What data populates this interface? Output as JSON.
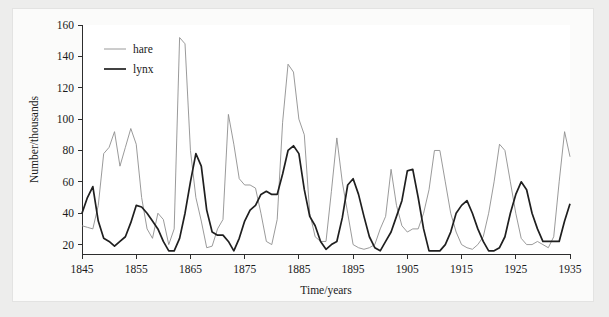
{
  "chart_data": {
    "type": "line",
    "title": "",
    "xlabel": "Time/years",
    "ylabel": "Number/thousands",
    "xlim": [
      1845,
      1935
    ],
    "ylim": [
      14,
      160
    ],
    "xticks": [
      1845,
      1855,
      1865,
      1875,
      1885,
      1895,
      1905,
      1915,
      1925,
      1935
    ],
    "yticks": [
      20,
      40,
      60,
      80,
      100,
      120,
      140,
      160
    ],
    "grid": false,
    "legend_position": "top-left-inside",
    "x": [
      1845,
      1846,
      1847,
      1848,
      1849,
      1850,
      1851,
      1852,
      1853,
      1854,
      1855,
      1856,
      1857,
      1858,
      1859,
      1860,
      1861,
      1862,
      1863,
      1864,
      1865,
      1866,
      1867,
      1868,
      1869,
      1870,
      1871,
      1872,
      1873,
      1874,
      1875,
      1876,
      1877,
      1878,
      1879,
      1880,
      1881,
      1882,
      1883,
      1884,
      1885,
      1886,
      1887,
      1888,
      1889,
      1890,
      1891,
      1892,
      1893,
      1894,
      1895,
      1896,
      1897,
      1898,
      1899,
      1900,
      1901,
      1902,
      1903,
      1904,
      1905,
      1906,
      1907,
      1908,
      1909,
      1910,
      1911,
      1912,
      1913,
      1914,
      1915,
      1916,
      1917,
      1918,
      1919,
      1920,
      1921,
      1922,
      1923,
      1924,
      1925,
      1926,
      1927,
      1928,
      1929,
      1930,
      1931,
      1932,
      1933,
      1934,
      1935
    ],
    "series": [
      {
        "name": "hare",
        "color": "#8f8f8f",
        "line_width": 0.9,
        "values": [
          32,
          31,
          30,
          45,
          78,
          82,
          92,
          70,
          82,
          94,
          84,
          50,
          30,
          24,
          40,
          36,
          20,
          30,
          152,
          148,
          80,
          50,
          35,
          18,
          19,
          30,
          36,
          103,
          84,
          62,
          58,
          58,
          56,
          40,
          22,
          20,
          36,
          98,
          135,
          130,
          100,
          90,
          40,
          25,
          22,
          22,
          54,
          88,
          60,
          40,
          20,
          18,
          17,
          18,
          20,
          30,
          38,
          68,
          45,
          32,
          28,
          30,
          30,
          40,
          55,
          80,
          80,
          60,
          40,
          28,
          20,
          18,
          17,
          20,
          25,
          40,
          60,
          84,
          80,
          60,
          40,
          24,
          20,
          20,
          22,
          20,
          18,
          25,
          60,
          92,
          76
        ]
      },
      {
        "name": "lynx",
        "color": "#1f1f1f",
        "line_width": 1.7,
        "values": [
          40,
          50,
          57,
          35,
          24,
          22,
          19,
          22,
          25,
          34,
          45,
          44,
          40,
          35,
          30,
          22,
          16,
          16,
          24,
          40,
          60,
          78,
          70,
          42,
          28,
          26,
          26,
          22,
          16,
          24,
          35,
          42,
          45,
          52,
          54,
          52,
          52,
          65,
          80,
          83,
          78,
          55,
          38,
          32,
          22,
          17,
          20,
          22,
          37,
          58,
          62,
          52,
          38,
          25,
          18,
          16,
          22,
          28,
          38,
          48,
          67,
          68,
          50,
          30,
          16,
          16,
          16,
          20,
          28,
          40,
          45,
          48,
          40,
          30,
          22,
          16,
          16,
          18,
          25,
          40,
          52,
          60,
          55,
          40,
          30,
          22,
          22,
          22,
          22,
          35,
          46
        ]
      }
    ],
    "legend": [
      {
        "label": "hare",
        "color": "#8f8f8f",
        "line_width": 0.9
      },
      {
        "label": "lynx",
        "color": "#1f1f1f",
        "line_width": 1.7
      }
    ]
  },
  "colors": {
    "page_background": "#ededec",
    "card_background": "#fbfbfa",
    "plot_background": "#ffffff",
    "axis": "#2d2d2d",
    "text": "#1a1a1a",
    "hare": "#8f8f8f",
    "lynx": "#1f1f1f"
  }
}
